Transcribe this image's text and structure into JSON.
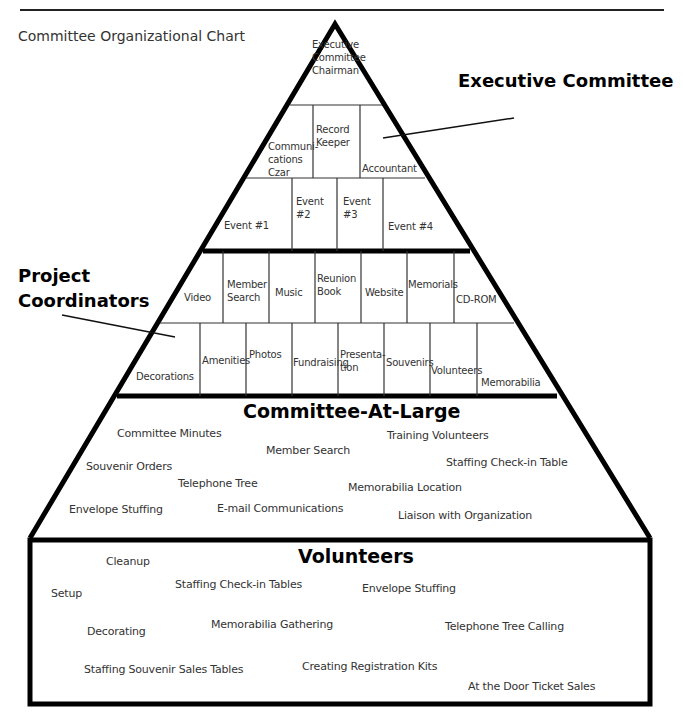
{
  "page_title": "Committee Organizational Chart",
  "callouts": {
    "executive": "Executive Committee",
    "project_line1": "Project",
    "project_line2": "Coordinators"
  },
  "pyramid": {
    "row1": [
      {
        "label": "Executive\nCommittee\nChairman",
        "x": 312,
        "y": 38
      }
    ],
    "row2": [
      {
        "label": "Communi-\ncations\nCzar",
        "x": 268,
        "y": 140
      },
      {
        "label": "Record\nKeeper",
        "x": 316,
        "y": 123
      },
      {
        "label": "Accountant",
        "x": 362,
        "y": 162
      }
    ],
    "row3": [
      {
        "label": "Event #1",
        "x": 224,
        "y": 219
      },
      {
        "label": "Event\n#2",
        "x": 296,
        "y": 195
      },
      {
        "label": "Event\n#3",
        "x": 343,
        "y": 195
      },
      {
        "label": "Event #4",
        "x": 388,
        "y": 220
      }
    ],
    "row4": [
      {
        "label": "Video",
        "x": 184,
        "y": 291
      },
      {
        "label": "Member\nSearch",
        "x": 227,
        "y": 278
      },
      {
        "label": "Music",
        "x": 275,
        "y": 286
      },
      {
        "label": "Reunion\nBook",
        "x": 317,
        "y": 272
      },
      {
        "label": "Website",
        "x": 365,
        "y": 286
      },
      {
        "label": "Memorials",
        "x": 408,
        "y": 278
      },
      {
        "label": "CD-ROM",
        "x": 456,
        "y": 293
      }
    ],
    "row5": [
      {
        "label": "Decorations",
        "x": 136,
        "y": 370
      },
      {
        "label": "Amenities",
        "x": 202,
        "y": 354
      },
      {
        "label": "Photos",
        "x": 249,
        "y": 348
      },
      {
        "label": "Fundraising",
        "x": 293,
        "y": 356
      },
      {
        "label": "Presenta-\ntion",
        "x": 340,
        "y": 348
      },
      {
        "label": "Souvenirs",
        "x": 386,
        "y": 356
      },
      {
        "label": "Volunteers",
        "x": 431,
        "y": 364
      },
      {
        "label": "Memorabilia",
        "x": 481,
        "y": 376
      }
    ]
  },
  "committee_at_large": {
    "heading": "Committee-At-Large",
    "items": [
      {
        "label": "Committee Minutes",
        "x": 117,
        "y": 428
      },
      {
        "label": "Training Volunteers",
        "x": 387,
        "y": 430
      },
      {
        "label": "Member Search",
        "x": 266,
        "y": 445
      },
      {
        "label": "Staffing Check-in Table",
        "x": 446,
        "y": 457
      },
      {
        "label": "Souvenir Orders",
        "x": 86,
        "y": 461
      },
      {
        "label": "Telephone Tree",
        "x": 178,
        "y": 478
      },
      {
        "label": "Memorabilia Location",
        "x": 348,
        "y": 482
      },
      {
        "label": "Envelope Stuffing",
        "x": 69,
        "y": 504
      },
      {
        "label": "E-mail Communications",
        "x": 217,
        "y": 503
      },
      {
        "label": "Liaison with Organization",
        "x": 398,
        "y": 510
      }
    ]
  },
  "volunteers": {
    "heading": "Volunteers",
    "items": [
      {
        "label": "Cleanup",
        "x": 106,
        "y": 556
      },
      {
        "label": "Staffing Check-in Tables",
        "x": 175,
        "y": 579
      },
      {
        "label": "Envelope Stuffing",
        "x": 362,
        "y": 583
      },
      {
        "label": "Setup",
        "x": 51,
        "y": 588
      },
      {
        "label": "Memorabilia Gathering",
        "x": 211,
        "y": 619
      },
      {
        "label": "Telephone Tree Calling",
        "x": 445,
        "y": 621
      },
      {
        "label": "Decorating",
        "x": 87,
        "y": 626
      },
      {
        "label": "Staffing Souvenir Sales Tables",
        "x": 84,
        "y": 664
      },
      {
        "label": "Creating Registration Kits",
        "x": 302,
        "y": 661
      },
      {
        "label": "At the Door Ticket Sales",
        "x": 468,
        "y": 681
      }
    ]
  }
}
